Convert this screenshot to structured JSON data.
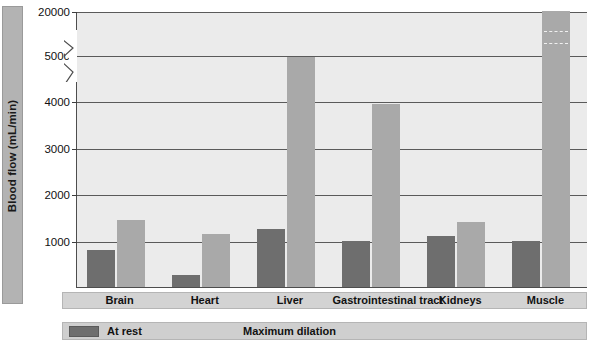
{
  "chart_data": {
    "type": "bar",
    "title": "",
    "xlabel": "",
    "ylabel": "Blood flow (mL/min)",
    "categories": [
      "Brain",
      "Heart",
      "Liver",
      "Gastrointestinal tract",
      "Kidneys",
      "Muscle"
    ],
    "series": [
      {
        "name": "At rest",
        "color": "#6e6e6e",
        "values": [
          800,
          250,
          1250,
          1000,
          1100,
          1000
        ]
      },
      {
        "name": "Maximum dilation",
        "color": "#a9a9a9",
        "values": [
          1450,
          1150,
          4950,
          3950,
          1400,
          20000
        ]
      }
    ],
    "ytick_labels": [
      "20000",
      "5000",
      "4000",
      "3000",
      "2000",
      "1000"
    ],
    "ytick_values": [
      20000,
      5000,
      4000,
      3000,
      2000,
      1000
    ],
    "ylim": [
      0,
      20000
    ],
    "axis_break": {
      "present": true,
      "between": [
        5000,
        20000
      ]
    },
    "grid": true,
    "legend_position": "bottom"
  },
  "axis": {
    "y_title": "Blood flow (mL/min)"
  },
  "legend": {
    "items": [
      {
        "label": "At rest"
      },
      {
        "label": "Maximum dilation"
      }
    ]
  }
}
